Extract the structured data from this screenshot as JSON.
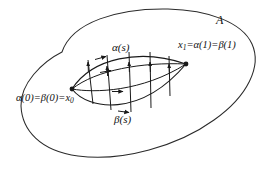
{
  "figure": {
    "type": "topology-homotopy-diagram",
    "background_color": "#ffffff",
    "stroke_color": "#1a1a1a",
    "labels": {
      "region": "A",
      "alpha_path": "α(s)",
      "beta_path": "β(s)",
      "endpoint_right_main": "x",
      "endpoint_right_sub": "1",
      "endpoint_right_rest": "=α(1)=β(1)",
      "endpoint_left_main": "α(0)=β(0)=x",
      "endpoint_left_sub": "0"
    },
    "elements": {
      "outer_blob": "region-A-boundary",
      "lens_upper": "alpha-path-curve",
      "lens_lower": "beta-path-curve",
      "intermediate_curves": 2,
      "homotopy_segments": 5,
      "vertex_dots": 2
    }
  }
}
